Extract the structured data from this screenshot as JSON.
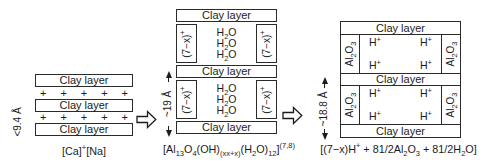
{
  "left": {
    "layer_label": "Clay layer",
    "plus": "+",
    "height_label": "<9.4 Å",
    "caption": [
      {
        "t": "[Ca]"
      },
      {
        "t": "+",
        "s": "sup"
      },
      {
        "t": "[Na]"
      }
    ]
  },
  "middle": {
    "layer_label": "Clay layer",
    "pillar": [
      {
        "t": "(7−x)"
      },
      {
        "t": "+",
        "s": "sup"
      }
    ],
    "water": [
      {
        "t": "H"
      },
      {
        "t": "2",
        "s": "sub"
      },
      {
        "t": "O"
      }
    ],
    "height_label": "~19 Å",
    "caption": [
      {
        "t": "[Al"
      },
      {
        "t": "13",
        "s": "sub"
      },
      {
        "t": "O"
      },
      {
        "t": "4",
        "s": "sub"
      },
      {
        "t": "(OH)"
      },
      {
        "t": "(xx+x)",
        "s": "sub"
      },
      {
        "t": "(H"
      },
      {
        "t": "2",
        "s": "sub"
      },
      {
        "t": "O)"
      },
      {
        "t": "12",
        "s": "sub"
      },
      {
        "t": "]"
      },
      {
        "t": "(7,8)",
        "s": "sup"
      }
    ]
  },
  "right": {
    "layer_label": "Clay layer",
    "pillar": [
      {
        "t": "Al"
      },
      {
        "t": "2",
        "s": "sub"
      },
      {
        "t": "O"
      },
      {
        "t": "3",
        "s": "sub"
      }
    ],
    "proton": [
      {
        "t": "H"
      },
      {
        "t": "+",
        "s": "sup"
      }
    ],
    "height_label": "~18.8 Å",
    "caption": [
      {
        "t": "[(7−x)H"
      },
      {
        "t": "+",
        "s": "sup"
      },
      {
        "t": " + 81/2Al"
      },
      {
        "t": "2",
        "s": "sub"
      },
      {
        "t": "O"
      },
      {
        "t": "3",
        "s": "sub"
      },
      {
        "t": " + 81/2H"
      },
      {
        "t": "2",
        "s": "sub"
      },
      {
        "t": "O]"
      }
    ]
  }
}
